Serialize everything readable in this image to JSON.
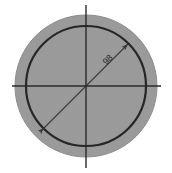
{
  "drawing": {
    "title": "Circle diameter dimension drawing",
    "canvas": {
      "width": 172,
      "height": 173,
      "background_color": "#ffffff"
    },
    "colors": {
      "fill_gray": "#9a9a9a",
      "outer_edge": "#8d8d8d",
      "inner_stroke": "#262626",
      "centerline": "#2a2a2a",
      "dimension_line": "#3a3a3a",
      "label_text": "#2b2b2b"
    },
    "center": {
      "x": 86,
      "y": 86
    },
    "outer_circle": {
      "name": "outer-circle",
      "radius": 71,
      "fill": "#9a9a9a",
      "stroke": "#8d8d8d",
      "stroke_width": 1
    },
    "inner_circle": {
      "name": "inner-circle",
      "radius": 60,
      "fill": "#9a9a9a",
      "stroke": "#262626",
      "stroke_width": 2.2
    },
    "centerlines": {
      "horizontal": {
        "x1": 12,
        "y1": 86,
        "x2": 161,
        "y2": 86
      },
      "vertical": {
        "x1": 86,
        "y1": 5,
        "x2": 86,
        "y2": 168
      },
      "stroke_width": 1.4
    },
    "dimension": {
      "name": "diameter-dimension",
      "label": "98",
      "angle_degrees": -45,
      "start": {
        "x": 44,
        "y": 128
      },
      "end": {
        "x": 128,
        "y": 44
      },
      "label_position": {
        "x": 108,
        "y": 60
      },
      "arrowheads": 2,
      "stroke_width": 1.1
    }
  }
}
